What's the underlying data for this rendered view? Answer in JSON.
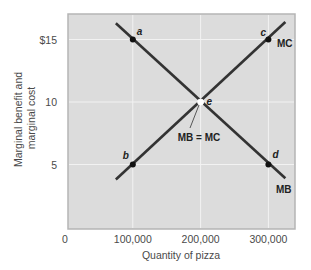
{
  "chart_data": {
    "type": "line",
    "title": "",
    "xlabel": "Quantity of pizza",
    "ylabel": "Marginal benefit and marginal cost",
    "ylabel_lines": [
      "Marginal benefit and",
      "marginal cost"
    ],
    "xlim": [
      0,
      330000
    ],
    "ylim": [
      0,
      17
    ],
    "x_ticks": [
      {
        "value": 0,
        "label": "0"
      },
      {
        "value": 100000,
        "label": "100,000"
      },
      {
        "value": 200000,
        "label": "200,000"
      },
      {
        "value": 300000,
        "label": "300,000"
      }
    ],
    "y_ticks": [
      {
        "value": 5,
        "label": "5"
      },
      {
        "value": 10,
        "label": "10"
      },
      {
        "value": 15,
        "label": "$15"
      }
    ],
    "grid": true,
    "series": [
      {
        "name": "MB",
        "label": "MB",
        "color": "#333333",
        "points": [
          [
            75000,
            16.3
          ],
          [
            325000,
            3.9
          ]
        ]
      },
      {
        "name": "MC",
        "label": "MC",
        "color": "#333333",
        "points": [
          [
            75000,
            3.8
          ],
          [
            325000,
            16.4
          ]
        ]
      }
    ],
    "points": [
      {
        "label": "a",
        "x": 100000,
        "y": 15
      },
      {
        "label": "b",
        "x": 100000,
        "y": 5
      },
      {
        "label": "c",
        "x": 300000,
        "y": 15
      },
      {
        "label": "d",
        "x": 300000,
        "y": 5
      },
      {
        "label": "e",
        "x": 200000,
        "y": 10
      }
    ],
    "annotations": [
      {
        "text": "MB = MC",
        "target": "e"
      }
    ],
    "legend": "none"
  },
  "colors": {
    "plot_bg": "#dcdcdc",
    "grid": "#f2f2f2",
    "frame": "#b5b5b5",
    "line": "#333333",
    "text": "#4a4a4a"
  }
}
